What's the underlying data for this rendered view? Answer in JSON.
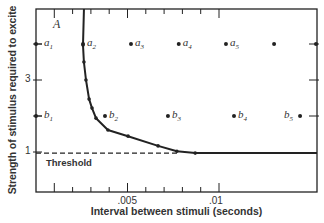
{
  "chart_data": {
    "type": "line",
    "title": "",
    "panel_label": "A",
    "xlabel": "Interval between stimuli (seconds)",
    "ylabel": "Strength of stimulus required to excite",
    "xlim": [
      0,
      0.0153
    ],
    "ylim": [
      0,
      5.2
    ],
    "x_ticks": [
      0.001,
      0.002,
      0.003,
      0.004,
      0.005,
      0.006,
      0.007,
      0.008,
      0.009,
      0.01
    ],
    "x_tick_labels": [
      {
        "value": 0.005,
        "label": ".005"
      },
      {
        "value": 0.01,
        "label": ".01"
      }
    ],
    "y_tick_labels": [
      {
        "value": 1,
        "label": "1"
      },
      {
        "value": 3,
        "label": "3"
      }
    ],
    "right_ticks": [
      2,
      3,
      4
    ],
    "grid": false,
    "series": [
      {
        "name": "Required strength curve",
        "style": "solid",
        "markers": true,
        "points": [
          [
            0.00262,
            5.05
          ],
          [
            0.00257,
            3.97
          ],
          [
            0.00262,
            3.5
          ],
          [
            0.00273,
            3.0
          ],
          [
            0.0029,
            2.47
          ],
          [
            0.00306,
            2.22
          ],
          [
            0.00328,
            1.94
          ],
          [
            0.00393,
            1.61
          ],
          [
            0.00503,
            1.44
          ],
          [
            0.00667,
            1.17
          ],
          [
            0.0077,
            1.02
          ],
          [
            0.0087,
            0.97
          ]
        ],
        "continuation": [
          [
            0.0087,
            0.97
          ],
          [
            0.0153,
            0.97
          ]
        ]
      },
      {
        "name": "Threshold",
        "style": "dashed",
        "points": [
          [
            0,
            0.97
          ],
          [
            0.0078,
            0.97
          ]
        ]
      }
    ],
    "point_rows": [
      {
        "row": "a",
        "y": 4,
        "points": [
          {
            "label": "a",
            "sub": "1",
            "x": 0.0
          },
          {
            "label": "a",
            "sub": "2",
            "x": 0.00257
          },
          {
            "label": "a",
            "sub": "3",
            "x": 0.00519
          },
          {
            "label": "a",
            "sub": "4",
            "x": 0.0078
          },
          {
            "label": "a",
            "sub": "5",
            "x": 0.01038
          },
          {
            "label": "",
            "sub": "",
            "x": 0.01301
          },
          {
            "label": "",
            "sub": "",
            "x": 0.0153
          }
        ]
      },
      {
        "row": "b",
        "y": 2,
        "points": [
          {
            "label": "b",
            "sub": "1",
            "x": 0.0
          },
          {
            "label": "b",
            "sub": "2",
            "x": 0.00377
          },
          {
            "label": "b",
            "sub": "3",
            "x": 0.00721
          },
          {
            "label": "b",
            "sub": "4",
            "x": 0.01082
          },
          {
            "label": "b",
            "sub": "5",
            "x": 0.01443
          }
        ]
      }
    ],
    "annotations": [
      {
        "text": "Threshold",
        "x": 0.0006,
        "y": 0.75
      }
    ]
  },
  "colors": {
    "ink": "#222222",
    "background": "#ffffff"
  }
}
